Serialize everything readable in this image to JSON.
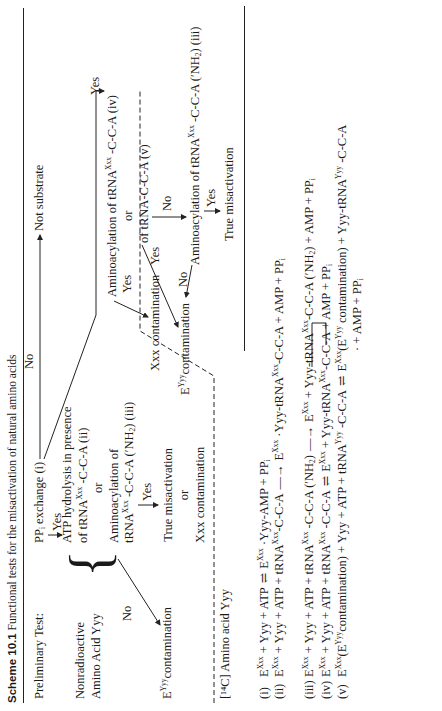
{
  "caption": {
    "label": "Scheme 10.1",
    "text": "Functional tests for the misactivation of natural amino acids"
  },
  "preliminary": {
    "heading": "Preliminary Test:",
    "test": "PP",
    "test_sub": "i",
    "test_rest": " exchange (i)",
    "no_label": "No",
    "no_result": "Not substrate",
    "yes_label": "Yes"
  },
  "nonradioactive": {
    "heading_line1": "Nonradioactive",
    "heading_line2": "Amino Acid Yyy",
    "test1_line1": "ATP hydrolysis in presence",
    "test1_line2_pre": "of tRNA",
    "test1_line2_sup": "Xxx",
    "test1_line2_post": " -C-C-A (ii)",
    "or": "or",
    "test2_line1": "Aminoacylation of",
    "test2_line2_pre": "tRNA",
    "test2_line2_sup": "Xxx",
    "test2_line2_post": " -C-C-A (′NH",
    "test2_line2_sub": "2",
    "test2_line2_end": ") (iii)",
    "no_label": "No",
    "no_result_pre": "E",
    "no_result_sup": "Yyy",
    "no_result_post": "contamination",
    "yes_label": "Yes",
    "yes_result1": "True misactivation",
    "yes_or": "or",
    "yes_result2": "Xxx contamination"
  },
  "radioactive": {
    "heading": "[¹⁴C] Amino acid Yyy",
    "yes_top": "Yes",
    "test1_pre": "Aminoacylation of tRNA",
    "test1_sup": "Xxx",
    "test1_post": " -C-C-A (iv)",
    "or": "or",
    "test2": "of tRNA-C-C-A (v)",
    "yes_left": "Yes",
    "result_xxx": "Xxx contamination",
    "yes_mid": "Yes",
    "result_eyyy_pre": "E",
    "result_eyyy_sup": "Yyy",
    "result_eyyy_post": "contamination",
    "no_label": "No",
    "test3_pre": "Aminoacylation of tRNA",
    "test3_sup": "Xxx",
    "test3_post": " -C-C-A (′NH",
    "test3_sub": "2",
    "test3_end": ") (iii)",
    "no_label2": "No",
    "yes_label2": "Yes",
    "final": "True misactivation"
  },
  "equations": [
    {
      "num": "(i)",
      "lhs": "E<sup>Xxx</sup> + Yyy + ATP",
      "arrow": "⇌",
      "rhs": "E<sup>Xxx</sup> ·Yyy-AMP + PP<sub>i</sub>"
    },
    {
      "num": "(ii)",
      "lhs": "E<sup>Xxx</sup> + Yyy + ATP + tRNA<sup>Xxx</sup>-C-C-A",
      "arrow": "—→",
      "rhs": "E<sup>Xxx</sup> ·Yyy-tRNA<sup>Xxx</sup>-C-C-A + AMP + PP<sub>i</sub>"
    },
    {
      "num": "(iii)",
      "lhs": "E<sup>Xxx</sup> + Yyy + ATP + tRNA<sup>Xxx</sup> -C-C-A (′NH<sub>2</sub>)",
      "arrow": "—→",
      "rhs": "E<sup>Xxx</sup> + Yyy-tRNA<sup>Xxx</sup>-C-C-A (′NH<sub>2</sub>) + AMP + PP<sub>i</sub>"
    },
    {
      "num": "(iv)",
      "lhs": "E<sup>Xxx</sup> + Yyy + ATP + tRNA<sup>Xxx</sup> -C-C-A",
      "arrow": "⇌",
      "rhs": "E<sup>Xxx</sup> + Yyy-tRNA<sup>Xxx</sup>-C-C-A + AMP + PP<sub>i</sub>"
    },
    {
      "num": "(v)",
      "lhs": "E<sup>Xxx</sup>(E<sup>Yyy</sup>contamination) + Yyy + ATP + tRNA<sup>Yyy</sup> -C-C-A",
      "arrow": "⇌",
      "rhs": "E<sup>Xxx</sup>(E<sup>Yyy</sup> contamination) + Yyy-tRNA<sup>Yyy</sup> -C-C-A"
    },
    {
      "num": "",
      "lhs": "",
      "arrow": "",
      "rhs": "· + AMP + PP<sub>i</sub>"
    }
  ]
}
